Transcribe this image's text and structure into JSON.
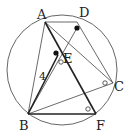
{
  "diagram": {
    "type": "inscribed-geometry",
    "circle": {
      "cx": 62,
      "cy": 70,
      "r": 55
    },
    "points": {
      "A": {
        "x": 45,
        "y": 22,
        "label": "A",
        "lx": 37,
        "ly": 19
      },
      "D": {
        "x": 77,
        "y": 28,
        "label": "D",
        "lx": 79,
        "ly": 17
      },
      "E": {
        "x": 56,
        "y": 54,
        "label": "E",
        "lx": 63,
        "ly": 63
      },
      "C": {
        "x": 113,
        "y": 83,
        "label": "C",
        "lx": 114,
        "ly": 91
      },
      "B": {
        "x": 28,
        "y": 114,
        "label": "B",
        "lx": 19,
        "ly": 130
      },
      "F": {
        "x": 96,
        "y": 114,
        "label": "F",
        "lx": 96,
        "ly": 130
      }
    },
    "segment_label": {
      "text": "4",
      "x": 39,
      "y": 80
    },
    "colors": {
      "line": "#333333",
      "thick": "#222222",
      "dot": "#111111"
    }
  }
}
